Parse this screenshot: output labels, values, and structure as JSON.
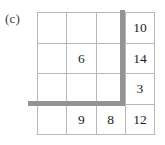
{
  "figure": {
    "panel_label": "(c)",
    "type": "grid-diagram",
    "colors": {
      "cell_border": "#b7b7b7",
      "thick_line": "#939393",
      "text": "#1c1c1c",
      "background": "#ffffff"
    }
  },
  "grid": {
    "rows": 4,
    "columns": 4,
    "cells": [
      [
        {
          "value": "",
          "empty": true
        },
        {
          "value": "",
          "empty": true
        },
        {
          "value": "",
          "empty": true
        },
        {
          "value": "10",
          "empty": false
        }
      ],
      [
        {
          "value": "",
          "empty": true
        },
        {
          "value": "6",
          "empty": false
        },
        {
          "value": "",
          "empty": true
        },
        {
          "value": "14",
          "empty": false
        }
      ],
      [
        {
          "value": "",
          "empty": true
        },
        {
          "value": "",
          "empty": true
        },
        {
          "value": "",
          "empty": true
        },
        {
          "value": "3",
          "empty": false
        }
      ],
      [
        {
          "value": "",
          "empty": true
        },
        {
          "value": "9",
          "empty": false
        },
        {
          "value": "8",
          "empty": false
        },
        {
          "value": "12",
          "empty": false
        }
      ]
    ]
  },
  "separators": {
    "vertical": {
      "name": "thick-vertical-line",
      "between_columns": "3-4",
      "spans_rows": "1-3"
    },
    "horizontal": {
      "name": "thick-horizontal-line",
      "between_rows": "3-4",
      "spans_columns": "1-3"
    }
  },
  "chart_data": {
    "type": "table",
    "title": "(c)",
    "columns": [
      "c1",
      "c2",
      "c3",
      "c4"
    ],
    "rows": [
      [
        "",
        "",
        "",
        "10"
      ],
      [
        "",
        "6",
        "",
        "14"
      ],
      [
        "",
        "",
        "",
        "3"
      ],
      [
        "",
        "9",
        "8",
        "12"
      ]
    ],
    "annotations": [
      "thick gray vertical rule between column 3 and column 4, from top of grid to row 3/4 boundary",
      "thick gray horizontal rule along row 3/4 boundary, from left of grid to the vertical rule"
    ],
    "grid": true,
    "legend": "none"
  }
}
